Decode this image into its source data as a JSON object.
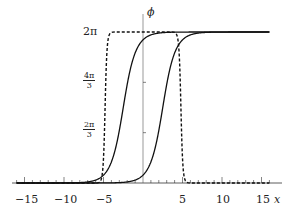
{
  "chart_data": {
    "type": "line",
    "title": "",
    "xlabel": "x",
    "ylabel": "ϕ",
    "xlim": [
      -16,
      16
    ],
    "ylim": [
      0,
      6.2832
    ],
    "x_ticks": [
      -15,
      -10,
      -5,
      5,
      10,
      15
    ],
    "x_tick_labels": [
      "−15",
      "−10",
      "−5",
      "5",
      "10",
      "15"
    ],
    "y_ticks": [
      2.0944,
      4.1888,
      6.2832
    ],
    "y_tick_labels": [
      "2π/3",
      "4π/3",
      "2π"
    ],
    "grid": false,
    "legend": null,
    "series": [
      {
        "name": "solid-kink-left",
        "style": "solid",
        "description": "kink from 0 to 2π centered near x ≈ -2.5",
        "center": -2.5,
        "width": 1.0,
        "from": 0,
        "to": 6.2832
      },
      {
        "name": "solid-kink-right",
        "style": "solid",
        "description": "kink from 0 to 2π centered near x ≈ 2.5",
        "center": 2.5,
        "width": 1.0,
        "from": 0,
        "to": 6.2832
      },
      {
        "name": "dashed-bump",
        "style": "dashed",
        "description": "sharp rise from 0 to 2π near x ≈ -4.8 and sharp fall back to 0 near x ≈ 4.8",
        "rise_at": -4.8,
        "fall_at": 4.8,
        "width": 0.15,
        "peak": 6.2832
      }
    ]
  },
  "labels": {
    "x_axis": "x",
    "y_axis": "ϕ",
    "x_m15": "−15",
    "x_m10": "−10",
    "x_m5": "−5",
    "x_5": "5",
    "x_10": "10",
    "x_15": "15",
    "y_2pi": "2π",
    "y_4pi3_num": "4π",
    "y_4pi3_den": "3",
    "y_2pi3_num": "2π",
    "y_2pi3_den": "3"
  }
}
